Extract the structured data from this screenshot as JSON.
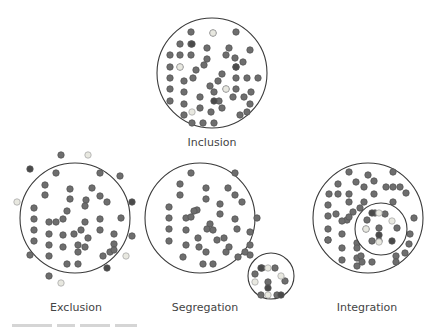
{
  "colors": {
    "line": "#3a3a3a",
    "dot": "#6e6e6e",
    "dot_dark": "#4a4a4a",
    "dot_light": "#e8e8e0",
    "dot_stroke": "#555555"
  },
  "labels": {
    "inclusion": "Inclusion",
    "exclusion": "Exclusion",
    "segregation": "Segregation",
    "integration": "Integration"
  },
  "diagrams": [
    {
      "id": "inclusion",
      "circle": {
        "cx": 212,
        "cy": 73,
        "r": 55
      },
      "dots": [
        [
          191,
          32
        ],
        [
          213,
          33
        ],
        [
          236,
          32
        ],
        [
          180,
          44
        ],
        [
          191,
          44
        ],
        [
          207,
          48
        ],
        [
          229,
          48
        ],
        [
          250,
          50
        ],
        [
          170,
          55
        ],
        [
          180,
          55
        ],
        [
          191,
          55
        ],
        [
          226,
          55
        ],
        [
          235,
          58
        ],
        [
          207,
          59
        ],
        [
          170,
          67
        ],
        [
          180,
          67
        ],
        [
          196,
          70
        ],
        [
          204,
          65
        ],
        [
          243,
          62
        ],
        [
          236,
          67
        ],
        [
          170,
          78
        ],
        [
          184,
          81
        ],
        [
          193,
          78
        ],
        [
          222,
          74
        ],
        [
          218,
          81
        ],
        [
          236,
          78
        ],
        [
          247,
          78
        ],
        [
          258,
          78
        ],
        [
          170,
          89
        ],
        [
          184,
          92
        ],
        [
          210,
          86
        ],
        [
          226,
          89
        ],
        [
          236,
          89
        ],
        [
          251,
          92
        ],
        [
          170,
          101
        ],
        [
          184,
          104
        ],
        [
          200,
          97
        ],
        [
          214,
          92
        ],
        [
          233,
          97
        ],
        [
          219,
          101
        ],
        [
          244,
          97
        ],
        [
          184,
          115
        ],
        [
          200,
          108
        ],
        [
          211,
          112
        ],
        [
          222,
          108
        ],
        [
          250,
          104
        ],
        [
          247,
          112
        ],
        [
          240,
          115
        ],
        [
          192,
          123
        ],
        [
          203,
          123
        ],
        [
          214,
          123
        ]
      ],
      "dark": [
        [
          192,
          44
        ],
        [
          236,
          67
        ],
        [
          214,
          101
        ]
      ],
      "light": [
        [
          213,
          33
        ],
        [
          180,
          67
        ],
        [
          226,
          89
        ],
        [
          192,
          112
        ]
      ]
    },
    {
      "id": "exclusion",
      "circle": {
        "cx": 75,
        "cy": 218,
        "r": 55
      },
      "dots": [
        [
          56,
          173
        ],
        [
          100,
          173
        ],
        [
          45,
          185
        ],
        [
          45,
          195
        ],
        [
          70,
          189
        ],
        [
          92,
          188
        ],
        [
          100,
          196
        ],
        [
          107,
          202
        ],
        [
          34,
          208
        ],
        [
          34,
          219
        ],
        [
          34,
          230
        ],
        [
          34,
          241
        ],
        [
          70,
          199
        ],
        [
          86,
          200
        ],
        [
          67,
          211
        ],
        [
          49,
          222
        ],
        [
          63,
          219
        ],
        [
          56,
          222
        ],
        [
          85,
          206
        ],
        [
          100,
          219
        ],
        [
          121,
          218
        ],
        [
          49,
          234
        ],
        [
          63,
          235
        ],
        [
          74,
          234
        ],
        [
          85,
          222
        ],
        [
          81,
          230
        ],
        [
          100,
          230
        ],
        [
          114,
          234
        ],
        [
          49,
          245
        ],
        [
          63,
          247
        ],
        [
          78,
          245
        ],
        [
          88,
          238
        ],
        [
          114,
          244
        ],
        [
          49,
          256
        ],
        [
          67,
          264
        ],
        [
          78,
          264
        ],
        [
          78,
          252
        ],
        [
          85,
          247
        ],
        [
          103,
          256
        ],
        [
          110,
          252
        ],
        [
          114,
          250
        ]
      ],
      "outside_dark": [
        [
          30,
          169
        ],
        [
          132,
          202
        ],
        [
          107,
          268
        ]
      ],
      "outside": [
        [
          61,
          155
        ],
        [
          120,
          176
        ],
        [
          30,
          255
        ],
        [
          132,
          236
        ],
        [
          49,
          276
        ]
      ],
      "outside_light": [
        [
          88,
          155
        ],
        [
          17,
          202
        ],
        [
          126,
          256
        ],
        [
          61,
          283
        ]
      ]
    },
    {
      "id": "segregation",
      "circle": {
        "cx": 200,
        "cy": 218,
        "r": 55
      },
      "dots": [
        [
          191,
          173
        ],
        [
          235,
          173
        ],
        [
          180,
          184
        ],
        [
          206,
          188
        ],
        [
          228,
          188
        ],
        [
          180,
          195
        ],
        [
          206,
          199
        ],
        [
          235,
          195
        ],
        [
          242,
          202
        ],
        [
          169,
          207
        ],
        [
          197,
          210
        ],
        [
          220,
          204
        ],
        [
          194,
          211
        ],
        [
          169,
          218
        ],
        [
          186,
          218
        ],
        [
          191,
          217
        ],
        [
          220,
          214
        ],
        [
          235,
          219
        ],
        [
          257,
          218
        ],
        [
          169,
          229
        ],
        [
          210,
          224
        ],
        [
          207,
          229
        ],
        [
          213,
          230
        ],
        [
          237,
          229
        ],
        [
          169,
          241
        ],
        [
          186,
          230
        ],
        [
          198,
          238
        ],
        [
          224,
          238
        ],
        [
          217,
          240
        ],
        [
          250,
          232
        ],
        [
          186,
          245
        ],
        [
          199,
          247
        ],
        [
          229,
          247
        ],
        [
          226,
          252
        ],
        [
          250,
          245
        ],
        [
          250,
          255
        ],
        [
          183,
          257
        ],
        [
          206,
          252
        ],
        [
          238,
          257
        ],
        [
          245,
          252
        ],
        [
          203,
          264
        ],
        [
          213,
          264
        ]
      ],
      "sub": {
        "circle": {
          "cx": 271,
          "cy": 276,
          "r": 23
        },
        "dots": [
          [
            262,
            268
          ],
          [
            275,
            268
          ],
          [
            255,
            274
          ],
          [
            268,
            282
          ],
          [
            285,
            281
          ],
          [
            261,
            295
          ],
          [
            277,
            295
          ]
        ],
        "dark": [
          [
            261,
            268
          ],
          [
            268,
            288
          ],
          [
            281,
            295
          ]
        ],
        "light": [
          [
            268,
            268
          ],
          [
            281,
            276
          ],
          [
            255,
            282
          ],
          [
            268,
            295
          ]
        ]
      }
    },
    {
      "id": "integration",
      "circle": {
        "cx": 368,
        "cy": 218,
        "r": 55
      },
      "dots": [
        [
          349,
          172
        ],
        [
          368,
          175
        ],
        [
          393,
          172
        ],
        [
          338,
          184
        ],
        [
          356,
          182
        ],
        [
          374,
          181
        ],
        [
          393,
          187
        ],
        [
          329,
          194
        ],
        [
          338,
          194
        ],
        [
          349,
          194
        ],
        [
          364,
          187
        ],
        [
          386,
          187
        ],
        [
          400,
          187
        ],
        [
          349,
          202
        ],
        [
          374,
          194
        ],
        [
          406,
          193
        ],
        [
          364,
          202
        ],
        [
          393,
          202
        ],
        [
          328,
          205
        ],
        [
          328,
          216
        ],
        [
          336,
          214
        ],
        [
          347,
          220
        ],
        [
          353,
          212
        ],
        [
          360,
          208
        ],
        [
          328,
          229
        ],
        [
          342,
          221
        ],
        [
          349,
          217
        ],
        [
          414,
          218
        ],
        [
          328,
          240
        ],
        [
          342,
          234
        ],
        [
          342,
          248
        ],
        [
          357,
          243
        ],
        [
          328,
          240
        ],
        [
          342,
          260
        ],
        [
          357,
          248
        ],
        [
          357,
          258
        ],
        [
          361,
          256
        ],
        [
          357,
          266
        ],
        [
          362,
          262
        ],
        [
          372,
          262
        ],
        [
          396,
          256
        ],
        [
          405,
          253
        ],
        [
          409,
          244
        ],
        [
          410,
          234
        ],
        [
          396,
          262
        ]
      ],
      "sub": {
        "circle": {
          "cx": 381,
          "cy": 229,
          "r": 26
        },
        "dots": [
          [
            367,
            220
          ],
          [
            385,
            214
          ],
          [
            375,
            213
          ],
          [
            397,
            228
          ],
          [
            379,
            228
          ],
          [
            379,
            241
          ],
          [
            372,
            241
          ],
          [
            366,
            229
          ]
        ],
        "dark": [
          [
            372,
            213
          ],
          [
            379,
            235
          ],
          [
            392,
            241
          ]
        ],
        "light": [
          [
            379,
            213
          ],
          [
            392,
            221
          ],
          [
            366,
            229
          ],
          [
            379,
            242
          ]
        ]
      }
    }
  ],
  "caption_visible": "partially cut off"
}
